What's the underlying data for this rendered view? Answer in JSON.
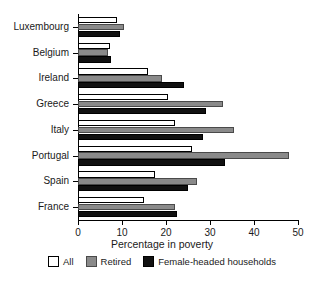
{
  "chart_data": {
    "type": "bar",
    "orientation": "horizontal",
    "title": "",
    "xlabel": "Percentage in poverty",
    "ylabel": "",
    "xlim": [
      0,
      50
    ],
    "xticks": [
      0,
      10,
      20,
      30,
      40,
      50
    ],
    "grid": false,
    "legend_position": "bottom",
    "categories": [
      "Luxembourg",
      "Belgium",
      "Ireland",
      "Greece",
      "Italy",
      "Portugal",
      "Spain",
      "France"
    ],
    "series": [
      {
        "name": "All",
        "color": "#ffffff",
        "values": [
          8.9,
          7.2,
          16.0,
          20.5,
          22.0,
          26.0,
          17.5,
          15.0
        ]
      },
      {
        "name": "Retired",
        "color": "#8a8a8a",
        "values": [
          10.5,
          6.8,
          19.0,
          33.0,
          35.5,
          48.0,
          27.0,
          22.0
        ]
      },
      {
        "name": "Female-headed households",
        "color": "#111111",
        "values": [
          9.5,
          7.5,
          24.0,
          29.0,
          28.5,
          33.5,
          25.0,
          22.5
        ]
      }
    ]
  },
  "axis": {
    "x_title": "Percentage in poverty"
  }
}
